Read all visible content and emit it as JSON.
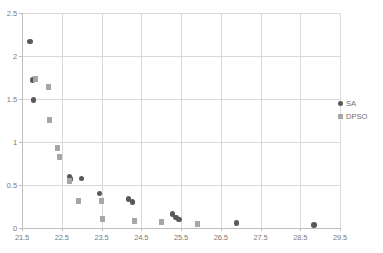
{
  "chart_data": {
    "type": "scatter",
    "title": "",
    "xlabel": "",
    "ylabel": "",
    "xlim": [
      21.5,
      29.5
    ],
    "ylim": [
      0,
      2.5
    ],
    "xticks": [
      "21.5",
      "22.5",
      "23.5",
      "24.5",
      "25.5",
      "26.5",
      "27.5",
      "28.5",
      "29.5"
    ],
    "yticks": [
      "0",
      "0.5",
      "1",
      "1.5",
      "2",
      "2.5"
    ],
    "grid": true,
    "legend_position": "right",
    "series": [
      {
        "name": "SA",
        "marker": "circle",
        "color": "#595959",
        "points": [
          [
            21.7,
            2.17
          ],
          [
            21.76,
            1.72
          ],
          [
            21.81,
            1.73
          ],
          [
            21.79,
            1.49
          ],
          [
            22.7,
            0.6
          ],
          [
            22.72,
            0.57
          ],
          [
            23.0,
            0.575
          ],
          [
            23.45,
            0.4
          ],
          [
            24.18,
            0.34
          ],
          [
            24.28,
            0.3
          ],
          [
            25.28,
            0.16
          ],
          [
            25.38,
            0.12
          ],
          [
            25.45,
            0.1
          ],
          [
            26.9,
            0.06
          ],
          [
            28.85,
            0.035
          ]
        ]
      },
      {
        "name": "DPSO",
        "marker": "square",
        "color": "#a6a6a6",
        "points": [
          [
            21.83,
            1.73
          ],
          [
            22.16,
            1.64
          ],
          [
            22.2,
            1.26
          ],
          [
            22.4,
            0.93
          ],
          [
            22.44,
            0.83
          ],
          [
            22.7,
            0.55
          ],
          [
            22.92,
            0.31
          ],
          [
            23.5,
            0.31
          ],
          [
            23.52,
            0.1
          ],
          [
            24.32,
            0.08
          ],
          [
            25.0,
            0.07
          ],
          [
            25.92,
            0.05
          ]
        ]
      }
    ]
  },
  "legend": {
    "entries": [
      {
        "label": "SA"
      },
      {
        "label": "DPSO"
      }
    ]
  }
}
